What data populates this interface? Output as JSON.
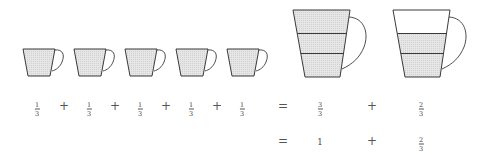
{
  "colors": {
    "outline": "#3a3a3a",
    "fill": "#e2e2e2",
    "background": "#ffffff"
  },
  "small_cups": {
    "count": 5,
    "fill_fraction": "1/3",
    "x": [
      23,
      74,
      125,
      176,
      227
    ]
  },
  "large_cups": [
    {
      "label": "full-jug",
      "bands": 3,
      "filled_bands": 3,
      "x": 293
    },
    {
      "label": "partial-jug",
      "bands": 3,
      "filled_bands": 2,
      "x": 393
    }
  ],
  "row1": {
    "terms": [
      {
        "num": "1",
        "den": "3"
      },
      {
        "num": "1",
        "den": "3"
      },
      {
        "num": "1",
        "den": "3"
      },
      {
        "num": "1",
        "den": "3"
      },
      {
        "num": "1",
        "den": "3"
      }
    ],
    "plus": "+",
    "equals": "=",
    "result_a": {
      "num": "3",
      "den": "3"
    },
    "result_b": {
      "num": "2",
      "den": "3"
    }
  },
  "row2": {
    "equals": "=",
    "whole": "1",
    "plus": "+",
    "result_b": {
      "num": "2",
      "den": "3"
    }
  }
}
